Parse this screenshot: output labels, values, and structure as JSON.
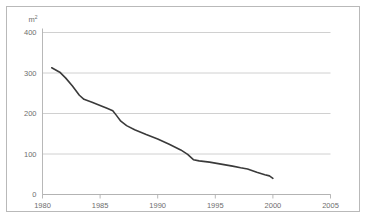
{
  "chart_data": {
    "type": "line",
    "title": "",
    "subtitle": "",
    "xlabel": "",
    "ylabel": "m²",
    "unit_label": "m",
    "unit_exponent": "2",
    "xlim": [
      1980,
      2005
    ],
    "ylim": [
      0,
      400
    ],
    "grid": "horizontal",
    "legend": "none",
    "x_ticks": [
      "1980",
      "1985",
      "1990",
      "1995",
      "2000",
      "2005"
    ],
    "x_tick_values": [
      1980,
      1985,
      1990,
      1995,
      2000,
      2005
    ],
    "y_ticks": [
      "0",
      "100",
      "200",
      "300",
      "400"
    ],
    "y_tick_values": [
      0,
      100,
      200,
      300,
      400
    ],
    "series": [
      {
        "name": "",
        "color": "#3a3a3a",
        "x": [
          1980.8,
          1981.5,
          1982.0,
          1982.6,
          1983.2,
          1983.6,
          1984.3,
          1985.0,
          1985.6,
          1986.1,
          1986.4,
          1986.8,
          1987.3,
          1988.0,
          1989.0,
          1990.0,
          1991.0,
          1992.0,
          1992.6,
          1993.1,
          1993.6,
          1994.5,
          1995.5,
          1996.5,
          1997.2,
          1997.8,
          1998.6,
          1999.3,
          1999.7,
          2000.0
        ],
        "y": [
          313,
          302,
          288,
          268,
          245,
          235,
          228,
          220,
          213,
          207,
          196,
          181,
          170,
          160,
          148,
          137,
          124,
          110,
          99,
          86,
          83,
          80,
          75,
          70,
          66,
          63,
          55,
          49,
          46,
          40
        ]
      }
    ]
  }
}
